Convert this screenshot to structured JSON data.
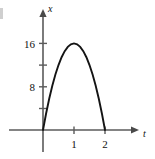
{
  "chart_data": {
    "type": "line",
    "title": "",
    "subtitle": "",
    "xlabel": "t",
    "ylabel": "x",
    "xlim": [
      -0.45,
      3.05
    ],
    "ylim": [
      -2.5,
      19.5
    ],
    "grid": false,
    "legend": null,
    "x_ticks": [
      {
        "value": 1,
        "label": "1"
      },
      {
        "value": 2,
        "label": "2"
      }
    ],
    "y_ticks": [
      {
        "value": 4,
        "label": ""
      },
      {
        "value": 8,
        "label": "8"
      },
      {
        "value": 12,
        "label": ""
      },
      {
        "value": 16,
        "label": "16"
      }
    ],
    "equation": "x = 32t - 16t^2",
    "series": [
      {
        "name": "x(t)",
        "color": "#141414",
        "x": [
          0.0,
          0.1,
          0.2,
          0.3,
          0.4,
          0.5,
          0.6,
          0.7,
          0.8,
          0.9,
          1.0,
          1.1,
          1.2,
          1.3,
          1.4,
          1.5,
          1.6,
          1.7,
          1.8,
          1.9,
          2.0
        ],
        "values": [
          0.0,
          3.04,
          5.76,
          8.16,
          10.24,
          12.0,
          13.44,
          14.56,
          15.36,
          15.84,
          16.0,
          15.84,
          15.36,
          14.56,
          13.44,
          12.0,
          10.24,
          8.16,
          5.76,
          3.04,
          0.0
        ]
      }
    ],
    "annotations": {
      "vertex": {
        "t": 1,
        "x": 16
      },
      "roots": [
        0,
        2
      ]
    }
  },
  "axes": {
    "y_axis_label": "x",
    "x_axis_label": "t",
    "y_arrow": "arrow-up-icon",
    "x_arrow": "arrow-right-icon"
  },
  "tick_labels": {
    "y_16": "16",
    "y_8": "8",
    "x_1": "1",
    "x_2": "2"
  }
}
